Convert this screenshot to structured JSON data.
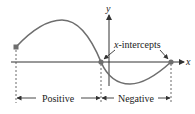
{
  "diagram": {
    "axis_labels": {
      "x": "x",
      "y": "y"
    },
    "annotation": {
      "prefix": "x",
      "suffix": "-intercepts"
    },
    "regions": [
      {
        "label": "Positive"
      },
      {
        "label": "Negative"
      }
    ],
    "colors": {
      "curve": "#6e6e6e",
      "axis": "#333333",
      "dot": "#6e6e6e",
      "text": "#222222"
    }
  }
}
